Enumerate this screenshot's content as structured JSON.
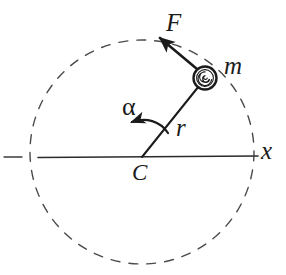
{
  "figure": {
    "background_color": "#ffffff",
    "ink_color": "#1b1b1b",
    "width": 286,
    "height": 275
  },
  "labels": {
    "force": "F",
    "mass": "m",
    "radius": "r",
    "angle": "α",
    "center": "C",
    "axis": "x"
  },
  "icons": {
    "mass_particle": "spiral-ball-icon",
    "force_arrow": "force-vector-arrow-icon",
    "angle_arrow": "curved-angle-arrow-icon",
    "dashed_circle": "dashed-circle-path-icon",
    "axis_line": "horizontal-axis-line-icon",
    "radius_line": "radius-segment-icon"
  },
  "geometry": {
    "center": {
      "x": 142,
      "y": 157
    },
    "circle_center": {
      "x": 142,
      "y": 152
    },
    "circle_radius": 112,
    "mass_position": {
      "x": 205,
      "y": 78
    },
    "mass_radius": 11,
    "force_tip": {
      "x": 157,
      "y": 35
    },
    "angle_degrees": 51,
    "axis_y": 157,
    "axis_start_x": 38,
    "axis_end_x": 258,
    "axis_stub_start_x": 4,
    "axis_stub_end_x": 22
  },
  "style": {
    "dash_pattern": "9 9",
    "line_width_solid": 1.6,
    "line_width_dashed": 1.4,
    "line_width_arrow": 2.6
  }
}
